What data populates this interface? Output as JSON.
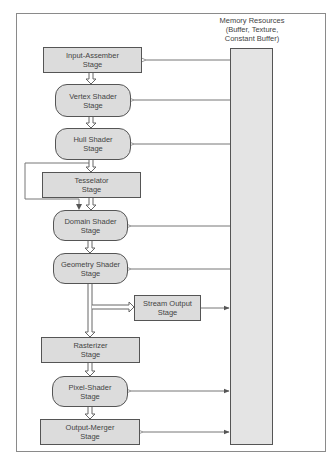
{
  "diagram": {
    "memory": {
      "title_line1": "Memory Resources",
      "title_line2": "(Buffer, Texture,",
      "title_line3": "Constant Buffer)"
    },
    "stages": [
      {
        "id": "input-assembler",
        "line1": "Input-Assember",
        "line2": "Stage",
        "shape": "rect"
      },
      {
        "id": "vertex-shader",
        "line1": "Vertex Shader",
        "line2": "Stage",
        "shape": "round"
      },
      {
        "id": "hull-shader",
        "line1": "Hull Shader",
        "line2": "Stage",
        "shape": "round"
      },
      {
        "id": "tessellator",
        "line1": "Tesselator",
        "line2": "Stage",
        "shape": "rect"
      },
      {
        "id": "domain-shader",
        "line1": "Domain Shader",
        "line2": "Stage",
        "shape": "round"
      },
      {
        "id": "geometry-shader",
        "line1": "Geometry Shader",
        "line2": "Stage",
        "shape": "round"
      },
      {
        "id": "stream-output",
        "line1": "Stream Output",
        "line2": "Stage",
        "shape": "rect"
      },
      {
        "id": "rasterizer",
        "line1": "Rasterizer",
        "line2": "Stage",
        "shape": "rect"
      },
      {
        "id": "pixel-shader",
        "line1": "Pixel-Shader",
        "line2": "Stage",
        "shape": "round"
      },
      {
        "id": "output-merger",
        "line1": "Output-Merger",
        "line2": "Stage",
        "shape": "rect"
      }
    ],
    "edges": [
      {
        "from": "input-assembler",
        "to": "vertex-shader",
        "type": "pipeline"
      },
      {
        "from": "vertex-shader",
        "to": "hull-shader",
        "type": "pipeline"
      },
      {
        "from": "hull-shader",
        "to": "tessellator",
        "type": "pipeline"
      },
      {
        "from": "hull-shader",
        "to": "domain-shader",
        "type": "bypass"
      },
      {
        "from": "tessellator",
        "to": "domain-shader",
        "type": "pipeline"
      },
      {
        "from": "domain-shader",
        "to": "geometry-shader",
        "type": "pipeline"
      },
      {
        "from": "geometry-shader",
        "to": "stream-output",
        "type": "pipeline"
      },
      {
        "from": "geometry-shader",
        "to": "rasterizer",
        "type": "pipeline"
      },
      {
        "from": "rasterizer",
        "to": "pixel-shader",
        "type": "pipeline"
      },
      {
        "from": "pixel-shader",
        "to": "output-merger",
        "type": "pipeline"
      },
      {
        "from": "memory",
        "to": "input-assembler",
        "type": "read"
      },
      {
        "from": "memory",
        "to": "vertex-shader",
        "type": "read"
      },
      {
        "from": "memory",
        "to": "hull-shader",
        "type": "read"
      },
      {
        "from": "memory",
        "to": "domain-shader",
        "type": "read"
      },
      {
        "from": "memory",
        "to": "geometry-shader",
        "type": "read"
      },
      {
        "from": "stream-output",
        "to": "memory",
        "type": "write"
      },
      {
        "from": "memory",
        "to": "pixel-shader",
        "type": "read-write"
      },
      {
        "from": "memory",
        "to": "output-merger",
        "type": "read-write"
      }
    ]
  }
}
